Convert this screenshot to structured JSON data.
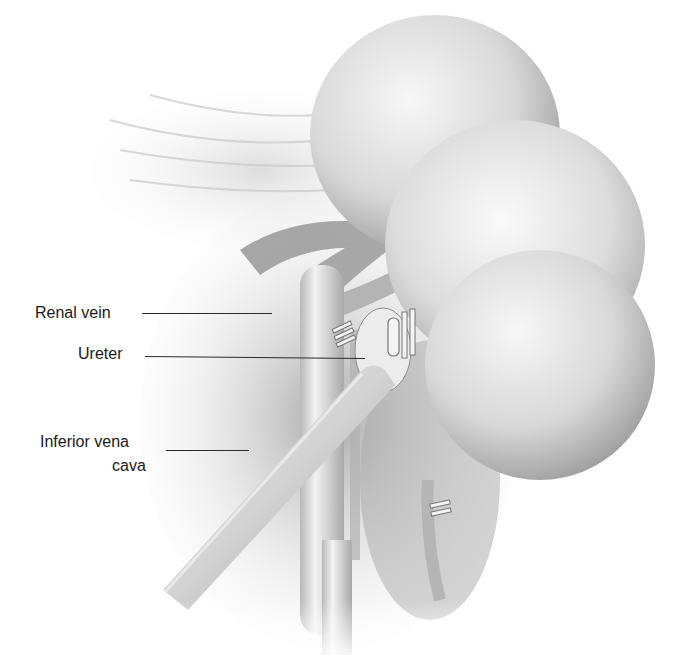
{
  "figure": {
    "labels": [
      {
        "id": "renal-vein",
        "text": "Renal vein"
      },
      {
        "id": "ureter",
        "text": "Ureter"
      },
      {
        "id": "ivc-line1",
        "text": "Inferior vena"
      },
      {
        "id": "ivc-line2",
        "text": "cava"
      }
    ],
    "colors": {
      "background": "#ffffff",
      "ink": "#1a1a1a",
      "kidney_light": "#f2f2f2",
      "kidney_shadow": "#9a9a9a",
      "tissue": "#bdbdbd"
    }
  }
}
